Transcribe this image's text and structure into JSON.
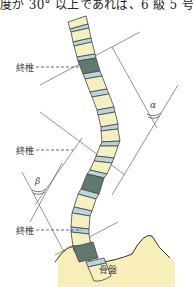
{
  "caption": {
    "text": "度が 30° 以上であれば、6 級 5 号が"
  },
  "figure": {
    "labels": {
      "end_vertebra_top": "終椎",
      "end_vertebra_middle": "終椎",
      "end_vertebra_bottom": "終椎",
      "pelvis": "骨盤"
    },
    "angles": {
      "upper_curve": "α",
      "lower_curve": "β"
    },
    "colors": {
      "vertebra_body": "#f6f0c0",
      "intervertebral_disc": "#b8d4e0",
      "end_vertebra": "#5f7a6c",
      "pelvis": "#f3e79a",
      "outline": "#444444",
      "guide_line": "#666666"
    }
  }
}
